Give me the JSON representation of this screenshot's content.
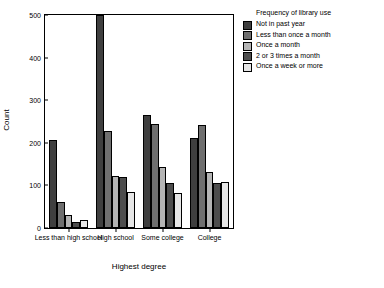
{
  "chart_data": {
    "type": "bar",
    "title": "",
    "xlabel": "Highest degree",
    "ylabel": "Count",
    "ylim": [
      0,
      500
    ],
    "yticks": [
      0,
      100,
      200,
      300,
      400,
      500
    ],
    "grid": false,
    "legend_position": "top-right-outside",
    "legend_title": "Frequency of library use",
    "categories": [
      "Less than high school",
      "High school",
      "Some college",
      "College"
    ],
    "series": [
      {
        "name": "Not in past year",
        "color": "#3f3f3f",
        "values": [
          207,
          500,
          265,
          212
        ]
      },
      {
        "name": "Less than once a month",
        "color": "#6f6f6f",
        "values": [
          62,
          228,
          243,
          242
        ]
      },
      {
        "name": "Once a month",
        "color": "#b4b4b4",
        "values": [
          30,
          122,
          143,
          132
        ]
      },
      {
        "name": "2 or 3 times a month",
        "color": "#4d4d4d",
        "values": [
          15,
          120,
          105,
          105
        ]
      },
      {
        "name": "Once a week or more",
        "color": "#e6e6e6",
        "values": [
          18,
          84,
          82,
          108
        ]
      }
    ]
  }
}
